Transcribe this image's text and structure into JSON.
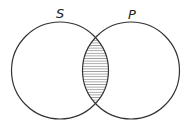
{
  "diagram": {
    "type": "venn",
    "sets": [
      {
        "label": "S",
        "cx": 60,
        "cy": 70.5,
        "r": 48.5
      },
      {
        "label": "P",
        "cx": 131,
        "cy": 70.5,
        "r": 48.5
      }
    ],
    "shaded_region": "S ∩ P",
    "shading_style": "horizontal-hatch",
    "stroke_color": "#333333",
    "hatch_color": "#555555"
  }
}
